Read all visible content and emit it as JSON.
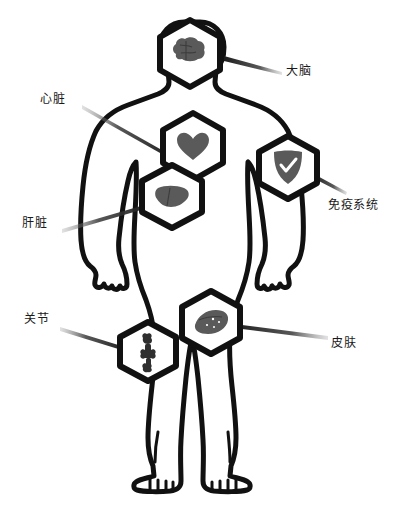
{
  "diagram": {
    "background_color": "#ffffff",
    "outline_color": "#111111",
    "organ_fill_color": "#5a5a5a",
    "pointer_color": "#2b2b2b",
    "text_color": "#1a1a1a",
    "figure": {
      "name": "human-body-silhouette",
      "style": "hand-drawn black outline, white fill"
    },
    "callouts": [
      {
        "id": "brain",
        "label": "大脑",
        "icon": "brain-icon",
        "badge_shape": "hexagon",
        "badge_center": {
          "x": 190,
          "y": 52
        },
        "label_position": {
          "x": 286,
          "y": 64
        },
        "pointer_from": {
          "x": 224,
          "y": 58
        },
        "pointer_to": {
          "x": 281,
          "y": 73
        }
      },
      {
        "id": "heart",
        "label": "心脏",
        "icon": "heart-icon",
        "badge_shape": "hexagon",
        "badge_center": {
          "x": 193,
          "y": 145
        },
        "label_position": {
          "x": 40,
          "y": 92
        },
        "pointer_from": {
          "x": 168,
          "y": 152
        },
        "pointer_to": {
          "x": 82,
          "y": 107
        }
      },
      {
        "id": "liver",
        "label": "肝脏",
        "icon": "liver-icon",
        "badge_shape": "hexagon",
        "badge_center": {
          "x": 172,
          "y": 196
        },
        "label_position": {
          "x": 22,
          "y": 216
        },
        "pointer_from": {
          "x": 152,
          "y": 200
        },
        "pointer_to": {
          "x": 64,
          "y": 231
        }
      },
      {
        "id": "immune",
        "label": "免疫系统",
        "icon": "shield-check-icon",
        "badge_shape": "hexagon",
        "badge_center": {
          "x": 288,
          "y": 167
        },
        "label_position": {
          "x": 328,
          "y": 198
        },
        "pointer_from": {
          "x": 313,
          "y": 176
        },
        "pointer_to": {
          "x": 345,
          "y": 195
        }
      },
      {
        "id": "joint",
        "label": "关节",
        "icon": "bone-joint-icon",
        "badge_shape": "hexagon",
        "badge_center": {
          "x": 148,
          "y": 351
        },
        "label_position": {
          "x": 24,
          "y": 312
        },
        "pointer_from": {
          "x": 125,
          "y": 345
        },
        "pointer_to": {
          "x": 62,
          "y": 330
        }
      },
      {
        "id": "skin",
        "label": "皮肤",
        "icon": "skin-layer-icon",
        "badge_shape": "hexagon",
        "badge_center": {
          "x": 211,
          "y": 322
        },
        "label_position": {
          "x": 331,
          "y": 336
        },
        "pointer_from": {
          "x": 236,
          "y": 327
        },
        "pointer_to": {
          "x": 326,
          "y": 340
        }
      }
    ]
  }
}
